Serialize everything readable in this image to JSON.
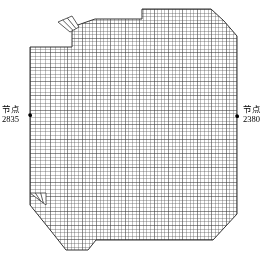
{
  "figure": {
    "kind": "finite-element-mesh-plate",
    "description_title": "",
    "background_color": "#ffffff",
    "mesh_line_color": "#555555",
    "outline_color": "#333333",
    "marker_color": "#000000",
    "width_px": 266,
    "height_px": 265
  },
  "annotations": {
    "left_node": {
      "name": "节点",
      "id": "2835",
      "dot_x": 30,
      "dot_y": 115
    },
    "right_node": {
      "name": "节点",
      "id": "2380",
      "dot_x": 237,
      "dot_y": 116
    }
  },
  "mesh_geometry": {
    "outline_polygon": [
      [
        72,
        47
      ],
      [
        72,
        27
      ],
      [
        95,
        19
      ],
      [
        142,
        19
      ],
      [
        142,
        9
      ],
      [
        211,
        9
      ],
      [
        224,
        21
      ],
      [
        237,
        36
      ],
      [
        237,
        214
      ],
      [
        213,
        240
      ],
      [
        96,
        240
      ],
      [
        88,
        250
      ],
      [
        66,
        250
      ],
      [
        51,
        231
      ],
      [
        30,
        205
      ],
      [
        30,
        47
      ]
    ],
    "tab_top_left": [
      [
        58,
        22
      ],
      [
        72,
        16
      ],
      [
        79,
        27
      ],
      [
        70,
        32
      ]
    ],
    "tab_bottom_left": [
      [
        30,
        193
      ],
      [
        46,
        193
      ],
      [
        46,
        205
      ],
      [
        38,
        199
      ]
    ],
    "grid": {
      "nominal_cell_px": 3.6,
      "coarse_left_band_x_end": 60,
      "coarse_left_cell_px": 5.0,
      "line_width_px": 0.6
    }
  },
  "chart_data": {
    "type": "mesh",
    "title": "",
    "xlabel": "",
    "ylabel": "",
    "nodes": [
      {
        "label": "节点 2835",
        "id": 2835,
        "x": 30,
        "y": 115,
        "side": "left"
      },
      {
        "label": "节点 2380",
        "id": 2380,
        "x": 237,
        "y": 116,
        "side": "right"
      }
    ]
  }
}
